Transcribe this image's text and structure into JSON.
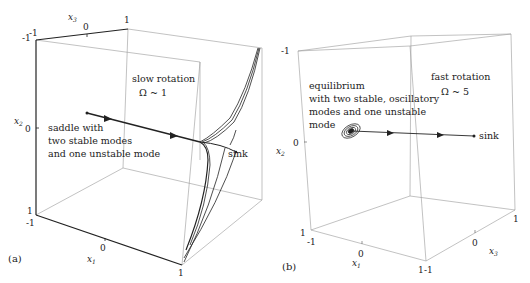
{
  "figure": {
    "panels": [
      {
        "id": "a",
        "panel_label": "(a)",
        "regime_title": "slow rotation",
        "regime_param": "Ω ~ 1",
        "start_annotation": [
          "saddle with",
          "two stable modes",
          "and one unstable mode"
        ],
        "end_annotation": "sink",
        "axes": {
          "x1": {
            "label": "x",
            "sub": "1",
            "ticks": [
              "-1",
              "0",
              "1"
            ]
          },
          "x2": {
            "label": "x",
            "sub": "2",
            "ticks": [
              "-1",
              "0",
              "1"
            ]
          },
          "x3": {
            "label": "x",
            "sub": "3",
            "ticks": [
              "-1",
              "0",
              "1"
            ]
          }
        },
        "tick_labels": {
          "top_left_x3": "-1",
          "top_left_x2": "-1",
          "x3_mid": "0",
          "x3_end": "1",
          "x2_mid": "0",
          "x2_bottom": "1",
          "x1_start": "-1",
          "x1_mid": "0",
          "x1_end": "1"
        }
      },
      {
        "id": "b",
        "panel_label": "(b)",
        "regime_title": "fast rotation",
        "regime_param": "Ω ~ 5",
        "start_annotation": [
          "equilibrium",
          "with two stable, oscillatory",
          "modes and one unstable",
          "mode"
        ],
        "end_annotation": "sink",
        "axes": {
          "x1": {
            "label": "x",
            "sub": "1",
            "ticks": [
              "-1",
              "0",
              "1"
            ]
          },
          "x2": {
            "label": "x",
            "sub": "2",
            "ticks": [
              "-1",
              "0",
              "1"
            ]
          },
          "x3": {
            "label": "x",
            "sub": "3",
            "ticks": [
              "-1",
              "0",
              "1"
            ]
          }
        },
        "tick_labels": {
          "x2_top": "-1",
          "x2_mid": "0",
          "x2_bottom": "1",
          "x1_start": "-1",
          "x1_mid": "0",
          "x1_end": "1",
          "x3_start": "-1",
          "x3_mid": "0",
          "x3_end": "1"
        }
      }
    ],
    "colors": {
      "line": "#222222",
      "box": "#888888",
      "background": "#ffffff"
    }
  }
}
